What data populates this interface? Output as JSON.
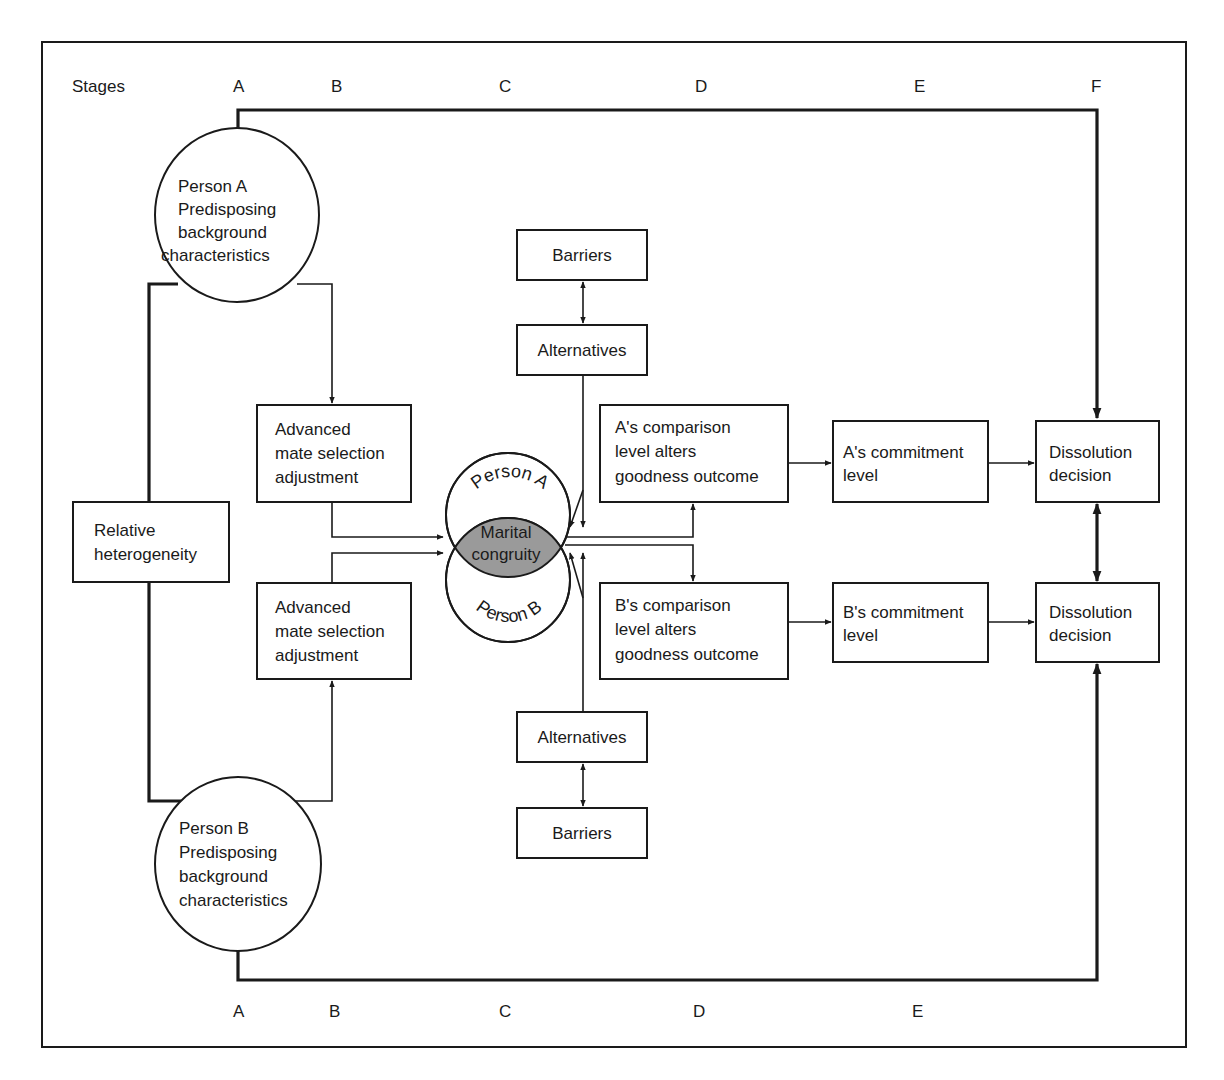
{
  "diagram": {
    "stages_top": {
      "heading": "Stages",
      "labels": [
        "A",
        "B",
        "C",
        "D",
        "E",
        "F"
      ]
    },
    "stages_bottom": {
      "labels": [
        "A",
        "B",
        "C",
        "D",
        "E"
      ]
    },
    "nodes": {
      "person_a": {
        "lines": [
          "Person A",
          "Predisposing",
          "background",
          "characteristics"
        ]
      },
      "person_b": {
        "lines": [
          "Person B",
          "Predisposing",
          "background",
          "characteristics"
        ]
      },
      "relative_heterogeneity": {
        "lines": [
          "Relative",
          "heterogeneity"
        ]
      },
      "adv_mate_a": {
        "lines": [
          "Advanced",
          "mate selection",
          "adjustment"
        ]
      },
      "adv_mate_b": {
        "lines": [
          "Advanced",
          "mate selection",
          "adjustment"
        ]
      },
      "barriers_top": {
        "lines": [
          "Barriers"
        ]
      },
      "alternatives_top": {
        "lines": [
          "Alternatives"
        ]
      },
      "alternatives_bottom": {
        "lines": [
          "Alternatives"
        ]
      },
      "barriers_bottom": {
        "lines": [
          "Barriers"
        ]
      },
      "marital_congruity": {
        "lines": [
          "Marital",
          "congruity"
        ],
        "arc_top": "Person A",
        "arc_bottom": "Person B",
        "fill_color": "#9a9a9a"
      },
      "a_comparison": {
        "lines": [
          "A's comparison",
          "level alters",
          "goodness outcome"
        ]
      },
      "b_comparison": {
        "lines": [
          "B's comparison",
          "level alters",
          "goodness outcome"
        ]
      },
      "a_commitment": {
        "lines": [
          "A's commitment",
          "level"
        ]
      },
      "b_commitment": {
        "lines": [
          "B's commitment",
          "level"
        ]
      },
      "dissolution_a": {
        "lines": [
          "Dissolution",
          "decision"
        ]
      },
      "dissolution_b": {
        "lines": [
          "Dissolution",
          "decision"
        ]
      }
    },
    "colors": {
      "line": "#1a1a1a",
      "background": "#ffffff",
      "congruity_fill": "#9a9a9a"
    }
  }
}
